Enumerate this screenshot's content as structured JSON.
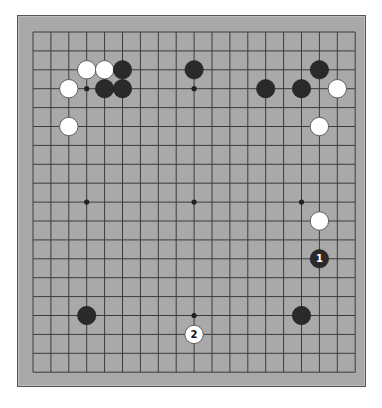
{
  "board": {
    "size": 19,
    "colors": {
      "board": "#a9a9a9",
      "line": "#3c3c3c",
      "black_stone": "#2a2a2a",
      "white_stone": "#ffffff",
      "white_stone_edge": "#555555"
    },
    "grid": {
      "x0": 33,
      "dx": 17.9,
      "y0": 32,
      "dy": 18.9
    },
    "star_points": [
      [
        3,
        3
      ],
      [
        9,
        3
      ],
      [
        15,
        3
      ],
      [
        3,
        9
      ],
      [
        9,
        9
      ],
      [
        15,
        9
      ],
      [
        3,
        15
      ],
      [
        9,
        15
      ],
      [
        15,
        15
      ]
    ],
    "stones": [
      {
        "color": "white",
        "col": 3,
        "row": 2,
        "label": ""
      },
      {
        "color": "white",
        "col": 4,
        "row": 2,
        "label": ""
      },
      {
        "color": "black",
        "col": 5,
        "row": 2,
        "label": ""
      },
      {
        "color": "white",
        "col": 2,
        "row": 3,
        "label": ""
      },
      {
        "color": "black",
        "col": 4,
        "row": 3,
        "label": ""
      },
      {
        "color": "black",
        "col": 5,
        "row": 3,
        "label": ""
      },
      {
        "color": "white",
        "col": 2,
        "row": 5,
        "label": ""
      },
      {
        "color": "black",
        "col": 9,
        "row": 2,
        "label": ""
      },
      {
        "color": "black",
        "col": 13,
        "row": 3,
        "label": ""
      },
      {
        "color": "black",
        "col": 15,
        "row": 3,
        "label": ""
      },
      {
        "color": "black",
        "col": 16,
        "row": 2,
        "label": ""
      },
      {
        "color": "white",
        "col": 17,
        "row": 3,
        "label": ""
      },
      {
        "color": "white",
        "col": 16,
        "row": 5,
        "label": ""
      },
      {
        "color": "white",
        "col": 16,
        "row": 10,
        "label": ""
      },
      {
        "color": "black",
        "col": 16,
        "row": 12,
        "label": "1"
      },
      {
        "color": "black",
        "col": 3,
        "row": 15,
        "label": ""
      },
      {
        "color": "black",
        "col": 15,
        "row": 15,
        "label": ""
      },
      {
        "color": "white",
        "col": 9,
        "row": 16,
        "label": "2"
      }
    ]
  }
}
